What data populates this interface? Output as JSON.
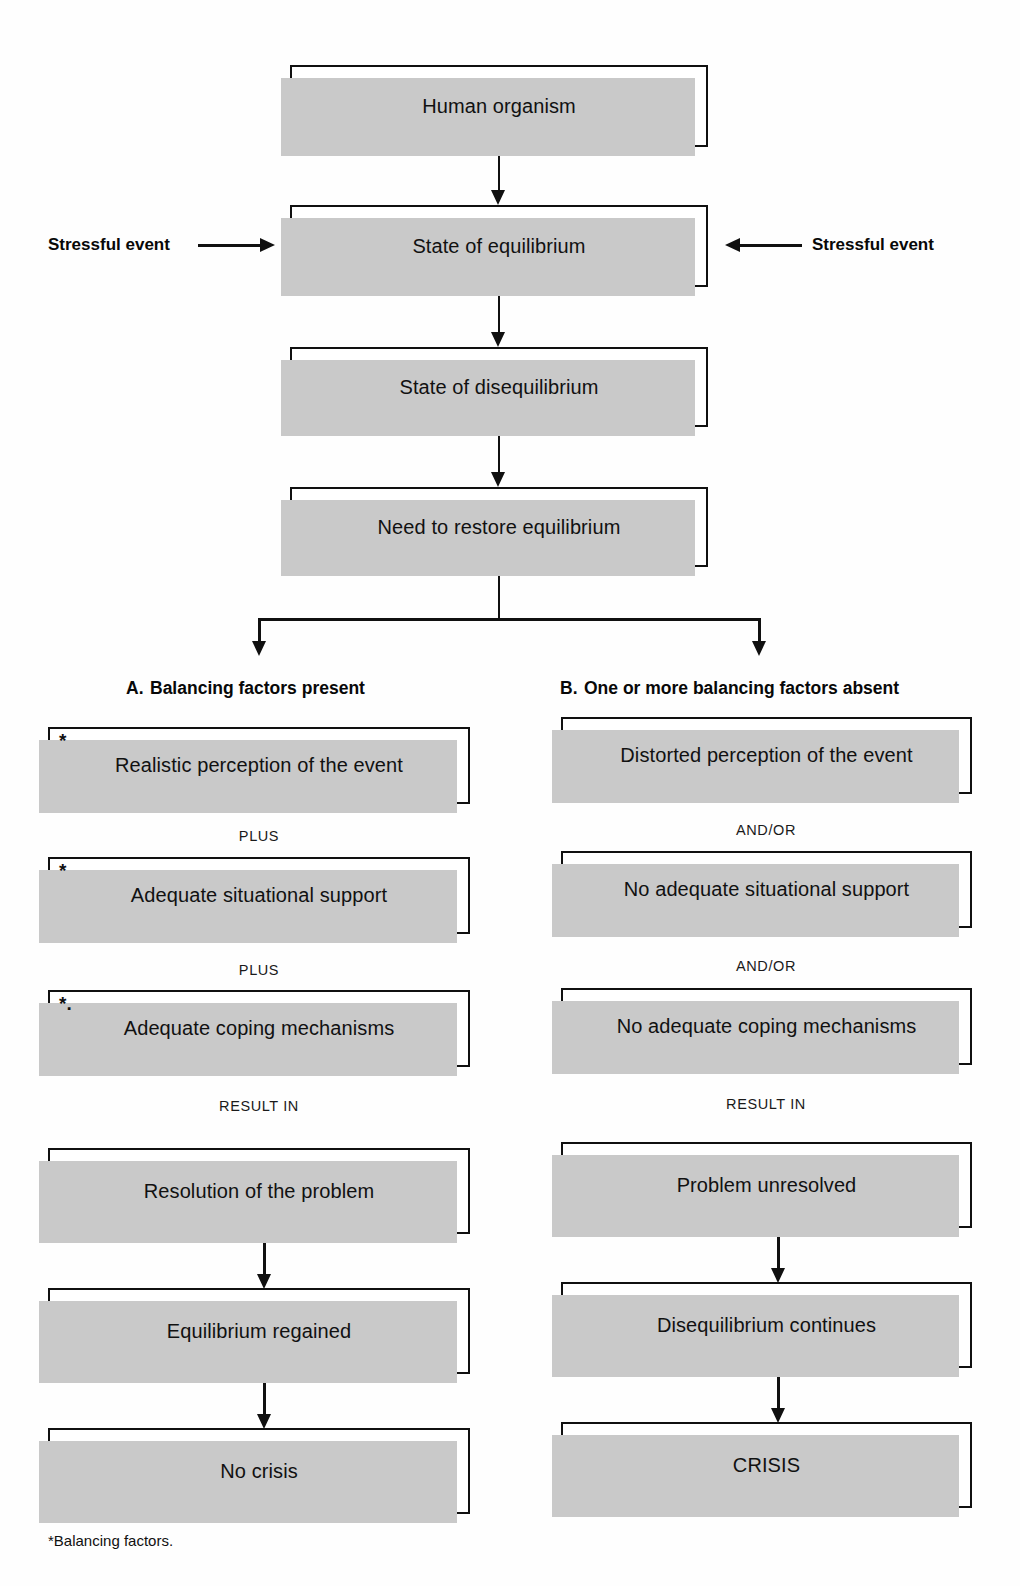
{
  "diagram": {
    "title_nodes": {
      "human_organism": "Human organism",
      "state_of_equilibrium": "State of equilibrium",
      "state_of_disequilibrium": "State of disequilibrium",
      "need_to_restore": "Need to restore equilibrium"
    },
    "side_labels": {
      "left": "Stressful event",
      "right": "Stressful event"
    },
    "branches": [
      {
        "letter": "A.",
        "heading": "Balancing factors present",
        "steps": [
          {
            "label": "Realistic perception of the event",
            "asterisk": "*"
          },
          {
            "label": "Adequate situational support",
            "asterisk": "*"
          },
          {
            "label": "Adequate coping mechanisms",
            "asterisk": "*."
          },
          {
            "label": "Resolution of the problem",
            "asterisk": ""
          },
          {
            "label": "Equilibrium  regained",
            "asterisk": ""
          },
          {
            "label": "No crisis",
            "asterisk": ""
          }
        ],
        "connectors": [
          "PLUS",
          "PLUS",
          "RESULT IN"
        ]
      },
      {
        "letter": "B.",
        "heading": "One or more balancing factors absent",
        "steps": [
          {
            "label": "Distorted perception of the event",
            "asterisk": ""
          },
          {
            "label": "No adequate situational support",
            "asterisk": ""
          },
          {
            "label": "No adequate coping mechanisms",
            "asterisk": ""
          },
          {
            "label": "Problem unresolved",
            "asterisk": ""
          },
          {
            "label": "Disequilibrium continues",
            "asterisk": ""
          },
          {
            "label": "CRISIS",
            "asterisk": ""
          }
        ],
        "connectors": [
          "AND/OR",
          "AND/OR",
          "RESULT IN"
        ]
      }
    ],
    "footnote": "*Balancing factors.",
    "colors": {
      "line": "#101010",
      "shadow": "#c9c9c9",
      "box_fill": "#ffffff",
      "page_bg": "#fefefe"
    }
  }
}
